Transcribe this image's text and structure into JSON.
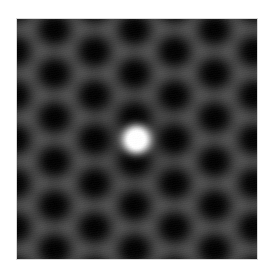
{
  "image": {
    "description": "Simulated atomic-resolution microscopy image of a hexagonal (honeycomb) lattice with a single bright point feature at the center",
    "width": 240,
    "height": 240,
    "background_color": "#ffffff",
    "border_color": "#d8d8d8"
  },
  "lattice": {
    "type": "hexagonal",
    "origin": [
      37,
      10
    ],
    "a1": [
      0,
      44
    ],
    "a2": [
      40,
      22
    ],
    "dark_level": 4,
    "grey_level": 78,
    "contrast_gamma": 1.6
  },
  "bright_feature": {
    "name": "central-bright-spot",
    "center": [
      119,
      120
    ],
    "core_radius": 12,
    "sigma": 8.5,
    "peak_level": 255,
    "dark_halo_sigma": 24,
    "dark_halo_strength": 0.35
  }
}
